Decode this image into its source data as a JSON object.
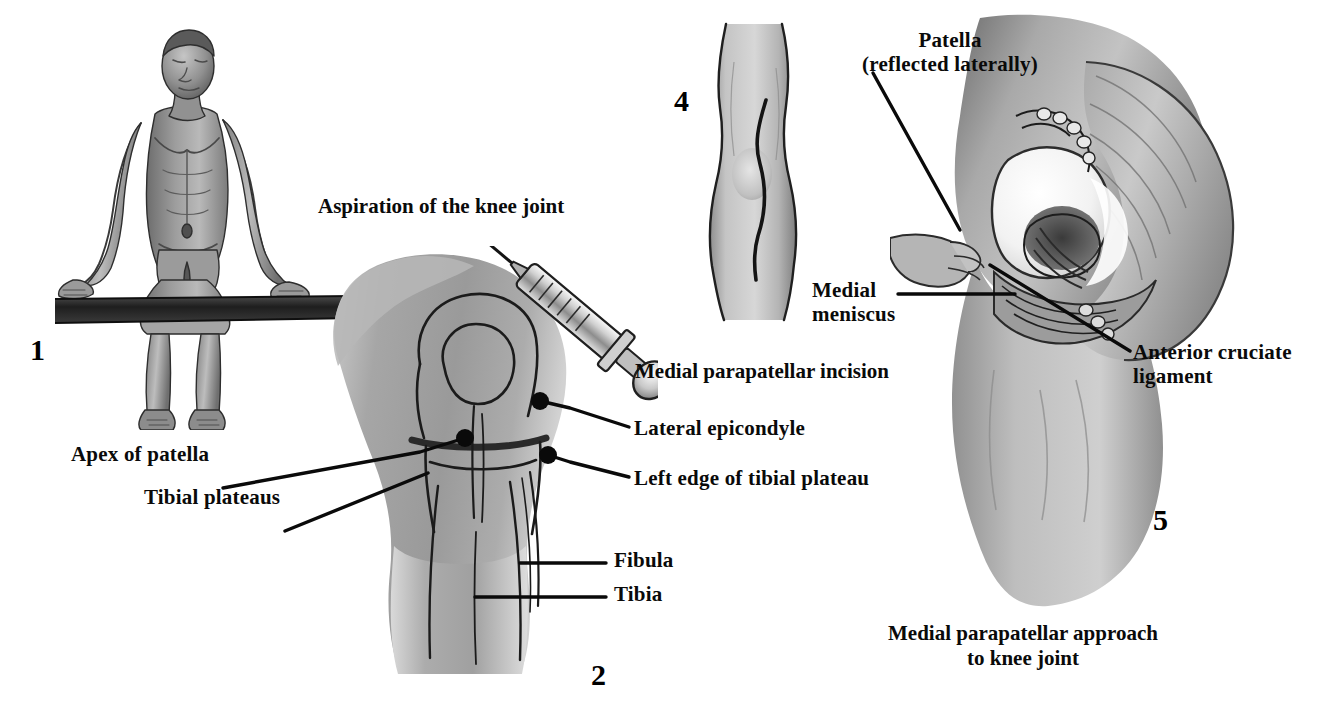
{
  "plate": {
    "title": "Aspiration and medial parapatellar approach to the knee joint",
    "background": "#ffffff",
    "ink": "#0a0a0a"
  },
  "figures": [
    {
      "id": "fig1",
      "number": "1",
      "x": 30,
      "y": 333,
      "subject": "seated-patient-on-bench"
    },
    {
      "id": "fig2",
      "number": "2",
      "x": 591,
      "y": 658,
      "subject": "anterior-knee-with-aspiration-syringe"
    },
    {
      "id": "fig4",
      "number": "4",
      "x": 674,
      "y": 84,
      "subject": "anterior-knee-incision-line"
    },
    {
      "id": "fig5",
      "number": "5",
      "x": 1153,
      "y": 503,
      "subject": "knee-joint-opened-medial-parapatellar"
    }
  ],
  "captions": [
    {
      "id": "aspiration-caption",
      "lines": [
        "Aspiration of the knee joint"
      ],
      "x": 318,
      "y": 194,
      "size": 21,
      "align": "left"
    },
    {
      "id": "incision-caption",
      "lines": [
        "Medial parapatellar incision"
      ],
      "x": 635,
      "y": 359,
      "size": 21,
      "align": "left"
    },
    {
      "id": "approach-caption",
      "lines": [
        "Medial parapatellar approach",
        "to knee joint"
      ],
      "x": 888,
      "y": 621,
      "size": 21,
      "align": "left"
    }
  ],
  "labels": [
    {
      "id": "patella-reflected",
      "lines": [
        "Patella",
        "(reflected laterally)"
      ],
      "x": 845,
      "y": 28,
      "size": 21,
      "align": "center",
      "width": 210
    },
    {
      "id": "apex-of-patella",
      "lines": [
        "Apex of patella"
      ],
      "x": 71,
      "y": 442,
      "size": 21,
      "align": "left"
    },
    {
      "id": "tibial-plateaus",
      "lines": [
        "Tibial plateaus"
      ],
      "x": 144,
      "y": 485,
      "size": 21,
      "align": "left"
    },
    {
      "id": "lateral-epicondyle",
      "lines": [
        "Lateral epicondyle"
      ],
      "x": 634,
      "y": 416,
      "size": 21,
      "align": "left"
    },
    {
      "id": "left-edge-tibial-plateau",
      "lines": [
        "Left edge of tibial plateau"
      ],
      "x": 634,
      "y": 466,
      "size": 21,
      "align": "left"
    },
    {
      "id": "fibula",
      "lines": [
        "Fibula"
      ],
      "x": 614,
      "y": 548,
      "size": 21,
      "align": "left"
    },
    {
      "id": "tibia",
      "lines": [
        "Tibia"
      ],
      "x": 614,
      "y": 582,
      "size": 21,
      "align": "left"
    },
    {
      "id": "medial-meniscus",
      "lines": [
        "Medial",
        "meniscus"
      ],
      "x": 812,
      "y": 278,
      "size": 21,
      "align": "left"
    },
    {
      "id": "anterior-cruciate-ligament",
      "lines": [
        "Anterior cruciate",
        "ligament"
      ],
      "x": 1133,
      "y": 340,
      "size": 21,
      "align": "left"
    }
  ],
  "leader_lines": [
    {
      "id": "leader-apex-of-patella",
      "points": "223,488 420,452 465,438"
    },
    {
      "id": "leader-tibial-plateaus",
      "points": "285,531 428,473"
    },
    {
      "id": "leader-lateral-epicondyle",
      "points": "629,427 570,408 540,401"
    },
    {
      "id": "leader-left-edge-tibial-plateau",
      "points": "629,477 570,462 548,455"
    },
    {
      "id": "leader-fibula",
      "points": "520,563 606,563"
    },
    {
      "id": "leader-tibia",
      "points": "475,597 606,597"
    },
    {
      "id": "leader-patella-reflected",
      "points": "873,73 960,230"
    },
    {
      "id": "leader-medial-meniscus",
      "points": "898,294 1015,294"
    },
    {
      "id": "leader-anterior-cruciate",
      "points": "1130,351 990,265"
    }
  ],
  "markers": [
    {
      "id": "apex-of-patella-dot",
      "x": 465,
      "y": 438,
      "r": 9
    },
    {
      "id": "lateral-epicondyle-dot",
      "x": 540,
      "y": 401,
      "r": 9
    },
    {
      "id": "left-edge-tibial-plateau-dot",
      "x": 548,
      "y": 455,
      "r": 9
    }
  ]
}
